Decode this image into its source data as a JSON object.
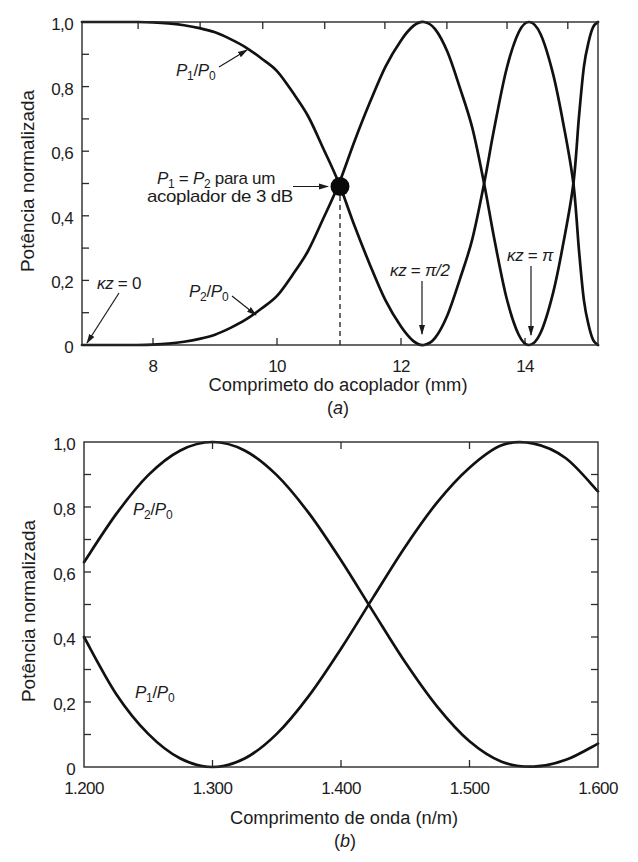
{
  "chart_data": [
    {
      "id": "a",
      "type": "line",
      "title": "",
      "panel_label": {
        "open": "(",
        "letter": "a",
        "close": ")"
      },
      "xlabel": "Comprimeto do acoplador (mm)",
      "ylabel": "Potência normalizada",
      "xlim": [
        6.855,
        15.177
      ],
      "ylim": [
        0,
        1
      ],
      "xticks": [
        8,
        10,
        12,
        14
      ],
      "xtick_labels": [
        "8",
        "10",
        "12",
        "14"
      ],
      "top_ticks": [
        7.76,
        8.76,
        9.77,
        10.77,
        11.74,
        12.74,
        13.71,
        14.69
      ],
      "yticks": [
        0,
        0.2,
        0.4,
        0.6,
        0.8,
        1.0
      ],
      "ytick_labels": [
        "0",
        "0,2",
        "0,4",
        "0,6",
        "0,8",
        "1,0"
      ],
      "y_minor_step": 0.1,
      "right_ticks": false,
      "grid": false,
      "legend": "none (curves labeled inline)",
      "x": [
        6.855,
        7.0,
        7.25,
        7.5,
        7.75,
        8.0,
        8.25,
        8.5,
        8.75,
        9.0,
        9.25,
        9.5,
        9.75,
        10.0,
        10.25,
        10.5,
        10.75,
        11.0,
        11.25,
        11.5,
        11.75,
        12.0,
        12.2,
        12.37,
        12.55,
        12.75,
        12.95,
        13.15,
        13.34,
        13.5,
        13.7,
        13.9,
        14.07,
        14.25,
        14.45,
        14.62,
        14.78,
        14.87,
        14.95,
        15.03,
        15.1,
        15.177
      ],
      "series": [
        {
          "name": "P1/P0",
          "values": [
            1.0,
            1.0,
            1.0,
            1.0,
            1.0,
            0.999,
            0.996,
            0.99,
            0.981,
            0.968,
            0.947,
            0.921,
            0.887,
            0.848,
            0.783,
            0.709,
            0.607,
            0.5,
            0.369,
            0.248,
            0.138,
            0.057,
            0.012,
            0.0,
            0.022,
            0.093,
            0.204,
            0.328,
            0.5,
            0.667,
            0.853,
            0.969,
            1.0,
            0.963,
            0.841,
            0.683,
            0.5,
            0.294,
            0.138,
            0.058,
            0.015,
            0.0
          ]
        },
        {
          "name": "P2/P0",
          "values": [
            0.0,
            0.0,
            0.0,
            0.0,
            0.0,
            0.001,
            0.004,
            0.01,
            0.019,
            0.032,
            0.053,
            0.079,
            0.113,
            0.152,
            0.217,
            0.291,
            0.393,
            0.5,
            0.631,
            0.752,
            0.862,
            0.943,
            0.988,
            1.0,
            0.978,
            0.907,
            0.796,
            0.672,
            0.5,
            0.333,
            0.147,
            0.031,
            0.0,
            0.037,
            0.159,
            0.317,
            0.5,
            0.706,
            0.862,
            0.942,
            0.985,
            1.0
          ]
        }
      ],
      "markers": [
        {
          "x": 11.0,
          "y": 0.5,
          "style": "filled-circle",
          "drop_line": "dashed"
        }
      ],
      "annotations": {
        "p1_ratio": {
          "num": "P",
          "num_sub": "1",
          "slash": "/",
          "den": "P",
          "den_sub": "0",
          "points_to": [
            9.55,
            0.92
          ]
        },
        "p2_ratio": {
          "num": "P",
          "num_sub": "2",
          "slash": "/",
          "den": "P",
          "den_sub": "0",
          "points_to": [
            9.65,
            0.09
          ]
        },
        "kz0": {
          "var": "κz",
          "eq": " = ",
          "val": "0",
          "points_to": [
            6.9,
            0.0
          ]
        },
        "kz_half_pi": {
          "var": "κz",
          "eq": " = ",
          "val": "π/2",
          "points_to": [
            12.37,
            0.0
          ]
        },
        "kz_pi": {
          "var": "κz",
          "eq": " = ",
          "val": "π",
          "points_to": [
            14.07,
            0.0
          ]
        },
        "three_db": {
          "a": "P",
          "a_sub": "1",
          "eq": " = ",
          "b": "P",
          "b_sub": "2",
          "rest": " para um",
          "line2": "acoplador de 3 dB",
          "points_to": [
            11.0,
            0.5
          ]
        }
      }
    },
    {
      "id": "b",
      "type": "line",
      "title": "",
      "panel_label": {
        "open": "(",
        "letter": "b",
        "close": ")"
      },
      "xlabel": "Comprimento de onda  (n/m)",
      "ylabel": "Potência normalizada",
      "xlim": [
        1200,
        1600
      ],
      "ylim": [
        0,
        1
      ],
      "xticks": [
        1200,
        1300,
        1400,
        1500,
        1600
      ],
      "xtick_labels": [
        "1.200",
        "1.300",
        "1.400",
        "1.500",
        "1.600"
      ],
      "top_ticks": [
        1300,
        1400,
        1500
      ],
      "yticks": [
        0,
        0.2,
        0.4,
        0.6,
        0.8,
        1.0
      ],
      "ytick_labels": [
        "0",
        "0,2",
        "0,4",
        "0,6",
        "0,8",
        "1,0"
      ],
      "y_minor_step": 0.1,
      "right_ticks": true,
      "grid": false,
      "legend": "none (curves labeled inline)",
      "x": [
        1200,
        1225,
        1250,
        1275,
        1300,
        1325,
        1350,
        1375,
        1400,
        1425,
        1450,
        1475,
        1500,
        1525,
        1550,
        1575,
        1600
      ],
      "series": [
        {
          "name": "P2/P0",
          "values": [
            0.63,
            0.778,
            0.898,
            0.974,
            1.0,
            0.974,
            0.898,
            0.781,
            0.636,
            0.478,
            0.322,
            0.185,
            0.079,
            0.016,
            0.001,
            0.022,
            0.072
          ]
        },
        {
          "name": "P1/P0",
          "values": [
            0.4,
            0.225,
            0.102,
            0.026,
            0.0,
            0.026,
            0.102,
            0.219,
            0.364,
            0.522,
            0.678,
            0.815,
            0.921,
            0.99,
            0.995,
            0.95,
            0.848
          ]
        }
      ],
      "annotations": {
        "p2_ratio": {
          "num": "P",
          "num_sub": "2",
          "slash": "/",
          "den": "P",
          "den_sub": "0"
        },
        "p1_ratio": {
          "num": "P",
          "num_sub": "1",
          "slash": "/",
          "den": "P",
          "den_sub": "0"
        }
      }
    }
  ]
}
